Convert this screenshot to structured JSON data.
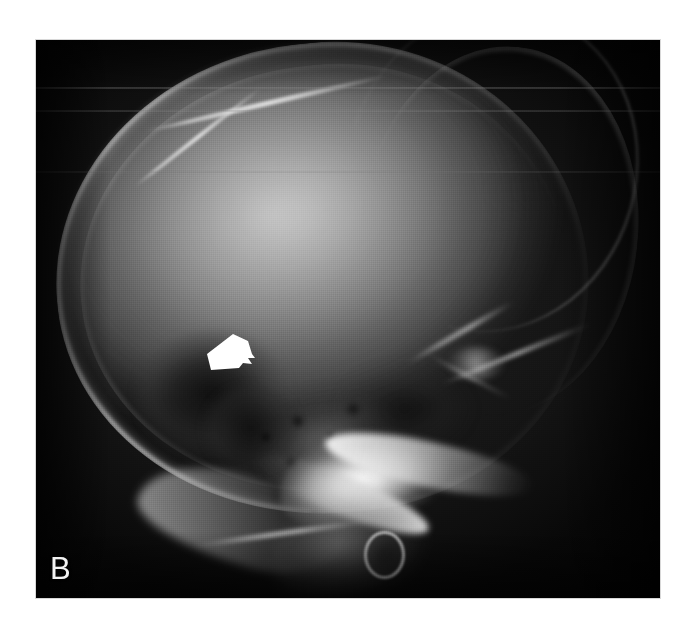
{
  "figure": {
    "panel_label": "B",
    "modality": "plain radiograph",
    "view": "lateral skull",
    "background_color": "#ffffff",
    "film_color": "#060606"
  },
  "annotations": {
    "arrow": {
      "name": "white-block-arrow",
      "color": "#ffffff",
      "direction": "down-left",
      "points_to": "lucent skull lesion"
    }
  },
  "anatomy": {
    "calvarium_label": "calvarium",
    "lesion_label": "lytic lucency",
    "petrous_label": "petrous temporal bone",
    "mastoid_label": "mastoid air cells",
    "zygoma_label": "zygomatic arch",
    "occiput_label": "occipital bone",
    "neck_label": "neck soft tissue"
  },
  "artifacts": {
    "scanline_label": "film scan line"
  }
}
